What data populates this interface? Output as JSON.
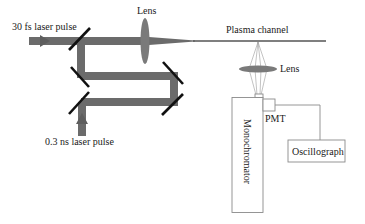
{
  "diagram": {
    "type": "optical-setup-schematic",
    "labels": {
      "fs_pulse": "30 fs laser pulse",
      "ns_pulse": "0.3 ns laser pulse",
      "lens_focus": "Lens",
      "plasma_channel": "Plasma channel",
      "lens_collect": "Lens",
      "pmt": "PMT",
      "monochromator": "Monochromator",
      "oscillograph": "Oscillograph"
    },
    "colors": {
      "beam": "#6b6b6b",
      "lens": "#7a7a7a",
      "mirror": "#111111",
      "box_stroke": "#8a8a8a",
      "text": "#1a1a1a"
    },
    "components": [
      {
        "id": "fs-input-beam",
        "kind": "beam",
        "label_ref": "fs_pulse"
      },
      {
        "id": "ns-input-beam",
        "kind": "beam",
        "label_ref": "ns_pulse"
      },
      {
        "id": "mirror-1",
        "kind": "mirror"
      },
      {
        "id": "mirror-2",
        "kind": "mirror"
      },
      {
        "id": "mirror-3",
        "kind": "mirror"
      },
      {
        "id": "mirror-4",
        "kind": "mirror"
      },
      {
        "id": "mirror-5",
        "kind": "mirror"
      },
      {
        "id": "focus-lens",
        "kind": "lens",
        "label_ref": "lens_focus"
      },
      {
        "id": "plasma-channel",
        "kind": "filament",
        "label_ref": "plasma_channel"
      },
      {
        "id": "collection-lens",
        "kind": "lens",
        "label_ref": "lens_collect"
      },
      {
        "id": "monochromator",
        "kind": "instrument",
        "label_ref": "monochromator"
      },
      {
        "id": "pmt",
        "kind": "detector",
        "label_ref": "pmt"
      },
      {
        "id": "oscillograph",
        "kind": "instrument",
        "label_ref": "oscillograph"
      }
    ],
    "connections": [
      {
        "from": "fs-input-beam",
        "to": "focus-lens"
      },
      {
        "from": "ns-input-beam",
        "to": "mirror-3"
      },
      {
        "from": "focus-lens",
        "to": "plasma-channel"
      },
      {
        "from": "plasma-channel",
        "to": "collection-lens"
      },
      {
        "from": "collection-lens",
        "to": "monochromator"
      },
      {
        "from": "monochromator",
        "to": "pmt"
      },
      {
        "from": "pmt",
        "to": "oscillograph"
      }
    ]
  }
}
